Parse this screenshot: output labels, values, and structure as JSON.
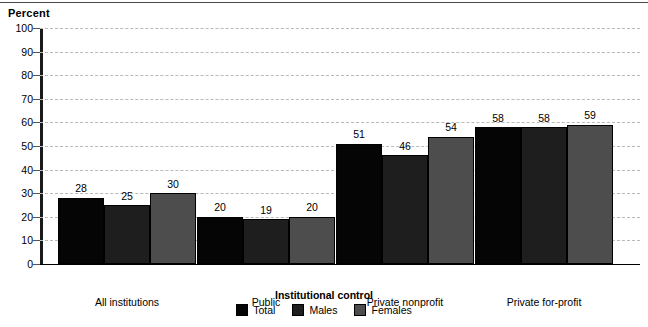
{
  "chart_data": {
    "type": "bar",
    "title": "",
    "ylabel": "Percent",
    "xlabel": "Institutional control",
    "ylim": [
      0,
      100
    ],
    "ytick_step": 10,
    "yticks": [
      0,
      10,
      20,
      30,
      40,
      50,
      60,
      70,
      80,
      90,
      100
    ],
    "grid": true,
    "legend_position": "bottom",
    "categories": [
      "All institutions",
      "Public",
      "Private nonprofit",
      "Private for-profit"
    ],
    "series": [
      {
        "name": "Total",
        "color": "#050505",
        "values": [
          28,
          20,
          51,
          58
        ]
      },
      {
        "name": "Males",
        "color": "#1e1e1e",
        "values": [
          25,
          19,
          46,
          58
        ]
      },
      {
        "name": "Females",
        "color": "#4d4d4d",
        "values": [
          30,
          20,
          54,
          59
        ]
      }
    ]
  }
}
